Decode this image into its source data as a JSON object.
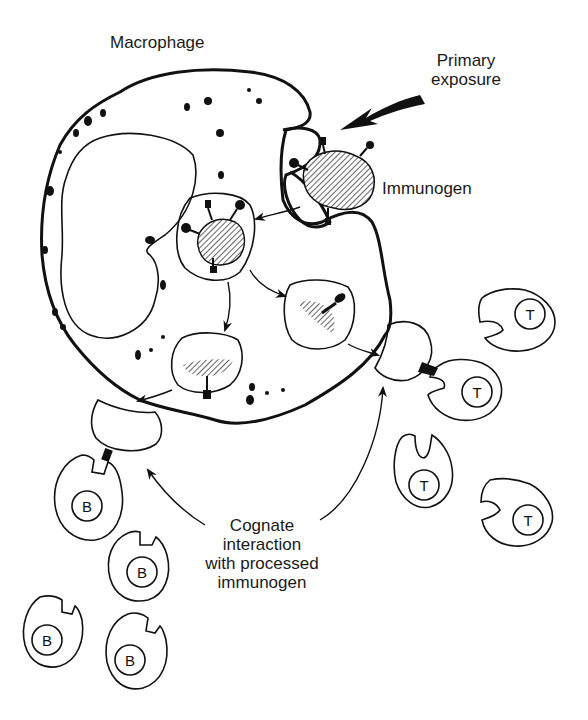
{
  "diagram": {
    "labels": {
      "macrophage": "Macrophage",
      "primary_exposure_line1": "Primary",
      "primary_exposure_line2": "exposure",
      "immunogen": "Immunogen",
      "cognate_line1": "Cognate",
      "cognate_line2": "interaction",
      "cognate_line3": "with processed",
      "cognate_line4": "immunogen"
    },
    "cells": {
      "b_letter": "B",
      "t_letter": "T",
      "b_cells": [
        {
          "id": "b1",
          "cx": 88,
          "cy": 500,
          "bound": true
        },
        {
          "id": "b2",
          "cx": 138,
          "cy": 560
        },
        {
          "id": "b3",
          "cx": 50,
          "cy": 628
        },
        {
          "id": "b4",
          "cx": 135,
          "cy": 650
        }
      ],
      "t_cells": [
        {
          "id": "t1",
          "cx": 520,
          "cy": 315
        },
        {
          "id": "t2",
          "cx": 465,
          "cy": 390,
          "bound": true
        },
        {
          "id": "t3",
          "cx": 424,
          "cy": 468
        },
        {
          "id": "t4",
          "cx": 518,
          "cy": 498
        }
      ]
    },
    "colors": {
      "ink": "#111111",
      "cytoplasm_dots": "#9a9a9a",
      "background": "#ffffff"
    }
  }
}
